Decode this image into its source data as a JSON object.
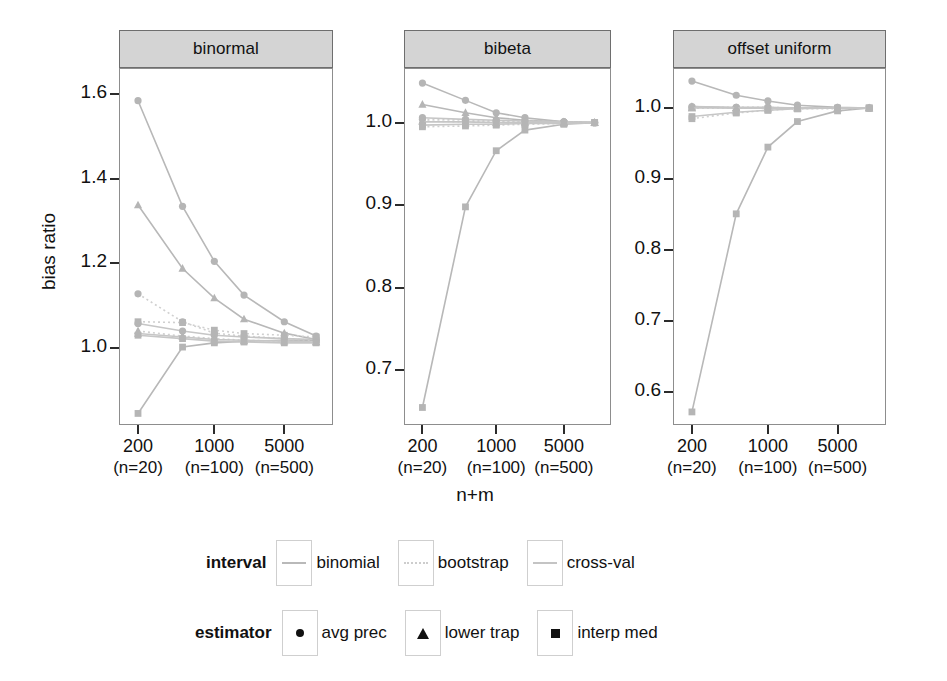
{
  "axes": {
    "ylabel": "bias ratio",
    "xlabel": "n+m"
  },
  "xtick_labels": [
    {
      "top": "200",
      "bottom": "(n=20)"
    },
    {
      "top": "1000",
      "bottom": "(n=100)"
    },
    {
      "top": "5000",
      "bottom": "(n=500)"
    }
  ],
  "legend": {
    "interval": {
      "title": "interval",
      "items": [
        {
          "label": "binomial",
          "style": "solid",
          "color": "#b9b9b9"
        },
        {
          "label": "bootstrap",
          "style": "dotted",
          "color": "#cdcdcd"
        },
        {
          "label": "cross-val",
          "style": "solid",
          "color": "#c4c4c4"
        }
      ]
    },
    "estimator": {
      "title": "estimator",
      "items": [
        {
          "label": "avg prec",
          "symbol": "circle"
        },
        {
          "label": "lower trap",
          "symbol": "triangle"
        },
        {
          "label": "interp med",
          "symbol": "square"
        }
      ]
    }
  },
  "chart_data": {
    "type": "line",
    "title": "",
    "xlabel": "n+m",
    "ylabel": "bias ratio",
    "grid": false,
    "legend_position": "bottom",
    "x": [
      200,
      500,
      1000,
      2000,
      5000,
      10000
    ],
    "x_tick_values": [
      200,
      1000,
      5000
    ],
    "x_scale": "log",
    "panels": [
      {
        "name": "binormal",
        "ylim": [
          0.82,
          1.66
        ],
        "yticks": [
          1.0,
          1.2,
          1.4,
          1.6
        ],
        "series": [
          {
            "name": "binomial avg prec",
            "interval": "binomial",
            "estimator": "avg prec",
            "values": [
              1.585,
              1.335,
              1.205,
              1.125,
              1.062,
              1.028
            ]
          },
          {
            "name": "binomial lower trap",
            "interval": "binomial",
            "estimator": "lower trap",
            "values": [
              1.338,
              1.188,
              1.118,
              1.068,
              1.035,
              1.02
            ]
          },
          {
            "name": "binomial interp med",
            "interval": "binomial",
            "estimator": "interp med",
            "values": [
              0.845,
              1.002,
              1.012,
              1.016,
              1.018,
              1.018
            ]
          },
          {
            "name": "bootstrap avg prec",
            "interval": "bootstrap",
            "estimator": "avg prec",
            "values": [
              1.128,
              1.062,
              1.035,
              1.028,
              1.022,
              1.018
            ]
          },
          {
            "name": "bootstrap lower trap",
            "interval": "bootstrap",
            "estimator": "lower trap",
            "values": [
              1.04,
              1.028,
              1.022,
              1.018,
              1.016,
              1.014
            ]
          },
          {
            "name": "bootstrap interp med",
            "interval": "bootstrap",
            "estimator": "interp med",
            "values": [
              1.062,
              1.06,
              1.042,
              1.034,
              1.03,
              1.026
            ]
          },
          {
            "name": "cross-val avg prec",
            "interval": "cross-val",
            "estimator": "avg prec",
            "values": [
              1.058,
              1.04,
              1.03,
              1.026,
              1.022,
              1.02
            ]
          },
          {
            "name": "cross-val lower trap",
            "interval": "cross-val",
            "estimator": "lower trap",
            "values": [
              1.034,
              1.026,
              1.02,
              1.018,
              1.016,
              1.014
            ]
          },
          {
            "name": "cross-val interp med",
            "interval": "cross-val",
            "estimator": "interp med",
            "values": [
              1.03,
              1.022,
              1.016,
              1.014,
              1.012,
              1.012
            ]
          }
        ]
      },
      {
        "name": "bibeta",
        "ylim": [
          0.635,
          1.065
        ],
        "yticks": [
          0.7,
          0.8,
          0.9,
          1.0
        ],
        "series": [
          {
            "name": "binomial avg prec",
            "interval": "binomial",
            "estimator": "avg prec",
            "values": [
              1.048,
              1.027,
              1.012,
              1.006,
              1.001,
              1.0
            ]
          },
          {
            "name": "binomial lower trap",
            "interval": "binomial",
            "estimator": "lower trap",
            "values": [
              1.022,
              1.012,
              1.006,
              1.003,
              1.001,
              1.0
            ]
          },
          {
            "name": "binomial interp med",
            "interval": "binomial",
            "estimator": "interp med",
            "values": [
              0.655,
              0.898,
              0.966,
              0.991,
              0.998,
              1.0
            ]
          },
          {
            "name": "bootstrap avg prec",
            "interval": "bootstrap",
            "estimator": "avg prec",
            "values": [
              1.004,
              1.003,
              1.002,
              1.002,
              1.001,
              1.0
            ]
          },
          {
            "name": "bootstrap lower trap",
            "interval": "bootstrap",
            "estimator": "lower trap",
            "values": [
              1.002,
              1.001,
              1.001,
              1.001,
              1.0,
              1.0
            ]
          },
          {
            "name": "bootstrap interp med",
            "interval": "bootstrap",
            "estimator": "interp med",
            "values": [
              0.995,
              0.996,
              0.997,
              0.998,
              0.999,
              1.0
            ]
          },
          {
            "name": "cross-val avg prec",
            "interval": "cross-val",
            "estimator": "avg prec",
            "values": [
              1.006,
              1.004,
              1.003,
              1.002,
              1.001,
              1.0
            ]
          },
          {
            "name": "cross-val lower trap",
            "interval": "cross-val",
            "estimator": "lower trap",
            "values": [
              1.001,
              1.001,
              1.0,
              1.0,
              1.0,
              1.0
            ]
          },
          {
            "name": "cross-val interp med",
            "interval": "cross-val",
            "estimator": "interp med",
            "values": [
              0.997,
              0.998,
              0.998,
              0.999,
              0.999,
              1.0
            ]
          }
        ]
      },
      {
        "name": "offset uniform",
        "ylim": [
          0.555,
          1.055
        ],
        "yticks": [
          0.6,
          0.7,
          0.8,
          0.9,
          1.0
        ],
        "series": [
          {
            "name": "binomial avg prec",
            "interval": "binomial",
            "estimator": "avg prec",
            "values": [
              1.038,
              1.018,
              1.01,
              1.004,
              1.001,
              1.0
            ]
          },
          {
            "name": "binomial lower trap",
            "interval": "binomial",
            "estimator": "lower trap",
            "values": [
              1.002,
              1.0,
              1.0,
              1.0,
              1.0,
              1.0
            ]
          },
          {
            "name": "binomial interp med",
            "interval": "binomial",
            "estimator": "interp med",
            "values": [
              0.572,
              0.851,
              0.945,
              0.981,
              0.996,
              1.0
            ]
          },
          {
            "name": "bootstrap avg prec",
            "interval": "bootstrap",
            "estimator": "avg prec",
            "values": [
              1.001,
              1.001,
              1.001,
              1.0,
              1.0,
              1.0
            ]
          },
          {
            "name": "bootstrap lower trap",
            "interval": "bootstrap",
            "estimator": "lower trap",
            "values": [
              1.0,
              1.0,
              1.0,
              1.0,
              1.0,
              1.0
            ]
          },
          {
            "name": "bootstrap interp med",
            "interval": "bootstrap",
            "estimator": "interp med",
            "values": [
              0.985,
              0.993,
              0.997,
              0.999,
              0.999,
              1.0
            ]
          },
          {
            "name": "cross-val avg prec",
            "interval": "cross-val",
            "estimator": "avg prec",
            "values": [
              1.002,
              1.001,
              1.001,
              1.0,
              1.0,
              1.0
            ]
          },
          {
            "name": "cross-val lower trap",
            "interval": "cross-val",
            "estimator": "lower trap",
            "values": [
              1.0,
              1.0,
              1.0,
              1.0,
              1.0,
              1.0
            ]
          },
          {
            "name": "cross-val interp med",
            "interval": "cross-val",
            "estimator": "interp med",
            "values": [
              0.988,
              0.994,
              0.997,
              0.999,
              1.0,
              1.0
            ]
          }
        ]
      }
    ]
  }
}
